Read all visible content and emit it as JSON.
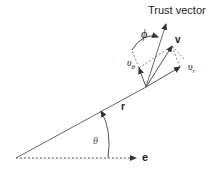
{
  "diagram": {
    "title_label": "Trust vector",
    "labels": {
      "phi": "ϕ",
      "v": "v",
      "v_theta": "υ",
      "v_theta_sub": "θ",
      "v_r": "υ",
      "v_r_sub": "r",
      "r": "r",
      "theta": "θ",
      "e": "e"
    },
    "colors": {
      "line": "#555555",
      "text": "#222222",
      "background": "#ffffff"
    }
  }
}
